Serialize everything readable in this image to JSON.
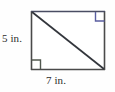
{
  "figure": {
    "type": "geometry-diagram",
    "shape": "rectangle-with-diagonal",
    "labels": {
      "height": "5 in.",
      "width": "7 in."
    },
    "colors": {
      "background": "#fefefe",
      "outline": "#4a4a4a",
      "top_edge": "#4a4d63",
      "diagonal": "#33363c",
      "right_angle_top_right": "#5a5ea0",
      "right_angle_bottom_left": "#51584f"
    },
    "geometry": {
      "rect_left": 31,
      "rect_top": 11,
      "rect_right": 105,
      "rect_bottom": 70,
      "diagonal_from": "top-left",
      "diagonal_to": "bottom-right",
      "right_angle_marks": [
        "top-right",
        "bottom-left"
      ],
      "right_angle_mark_size": 9
    }
  }
}
